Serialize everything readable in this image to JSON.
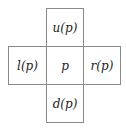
{
  "diagram": {
    "type": "neighborhood-cross",
    "cells": {
      "up": "u(p)",
      "left": "l(p)",
      "center": "p",
      "right": "r(p)",
      "down": "d(p)"
    },
    "border_color": "#8a8a8a",
    "text_color": "#222222"
  }
}
